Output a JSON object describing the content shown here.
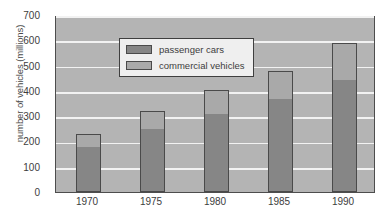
{
  "chart_data": {
    "type": "bar",
    "subtype": "stacked-bar",
    "title": "",
    "xlabel": "",
    "ylabel": "number of vehicles (millions)",
    "categories": [
      "1970",
      "1975",
      "1980",
      "1985",
      "1990"
    ],
    "series": [
      {
        "name": "passenger cars",
        "color": "#868686",
        "values": [
          180,
          250,
          310,
          370,
          443
        ]
      },
      {
        "name": "commercial vehicles",
        "color": "#a9a9a9",
        "values": [
          50,
          70,
          95,
          110,
          145
        ]
      }
    ],
    "totals": [
      230,
      320,
      405,
      480,
      588
    ],
    "ylim": [
      0,
      700
    ],
    "yticks": [
      0,
      100,
      200,
      300,
      400,
      500,
      600,
      700
    ],
    "ytick_labels": [
      "0",
      "100",
      "200",
      "300",
      "400",
      "500",
      "600",
      "700"
    ],
    "grid": "horizontal",
    "gridline_color": "#f2f2f2",
    "plot_background": "#b4b4b4",
    "legend_position": "top-left"
  },
  "legend": {
    "items": [
      {
        "label": "passenger cars",
        "swatch": "passenger-swatch"
      },
      {
        "label": "commercial vehicles",
        "swatch": "commercial-swatch"
      }
    ]
  }
}
